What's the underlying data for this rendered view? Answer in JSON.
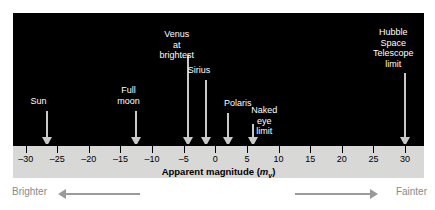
{
  "chart_data": {
    "type": "scatter",
    "title": "",
    "xlabel": "Apparent magnitude (m_v)",
    "xlabel_main": "Apparent magnitude (",
    "xlabel_italic": "m",
    "xlabel_sub": "v",
    "xlabel_close": ")",
    "ylabel": "",
    "xlim": [
      -32,
      33
    ],
    "xticks": [
      -30,
      -25,
      -20,
      -15,
      -10,
      -5,
      0,
      5,
      10,
      15,
      20,
      25,
      30
    ],
    "xtick_labels": [
      "–30",
      "–25",
      "–20",
      "–15",
      "–10",
      "–5",
      "0",
      "5",
      "10",
      "15",
      "20",
      "25",
      "30"
    ],
    "grid": false,
    "legend": "none",
    "annotations": [
      {
        "label": "Sun",
        "value": -26.7,
        "lines": [
          "Sun"
        ],
        "label_top": 83,
        "label_offset": -16,
        "shaft_top": 98,
        "shaft_height": 26
      },
      {
        "label": "Full moon",
        "value": -12.5,
        "lines": [
          "Full",
          "moon"
        ],
        "label_top": 72,
        "label_offset": -19,
        "shaft_top": 98,
        "shaft_height": 26
      },
      {
        "label": "Venus at brightest",
        "value": -4.4,
        "lines": [
          "Venus at",
          "brightest"
        ],
        "label_top": 16,
        "label_offset": -28,
        "shaft_top": 42,
        "shaft_height": 82
      },
      {
        "label": "Sirius",
        "value": -1.5,
        "lines": [
          "Sirius"
        ],
        "label_top": 52,
        "label_offset": -18,
        "shaft_top": 67,
        "shaft_height": 57
      },
      {
        "label": "Polaris",
        "value": 2.0,
        "lines": [
          "Polaris"
        ],
        "label_top": 85,
        "label_offset": -4,
        "shaft_top": 100,
        "shaft_height": 24
      },
      {
        "label": "Naked eye limit",
        "value": 6.0,
        "lines": [
          "Naked",
          "eye limit"
        ],
        "label_top": 92,
        "label_offset": -2,
        "shaft_top": 111,
        "shaft_height": 13
      },
      {
        "label": "Hubble Space Telescope limit",
        "value": 30.0,
        "lines": [
          "Hubble",
          "Space",
          "Telescope",
          "limit"
        ],
        "label_top": 14,
        "label_offset": -32,
        "shaft_top": 60,
        "shaft_height": 64
      }
    ]
  },
  "direction": {
    "brighter_label": "Brighter",
    "fainter_label": "Fainter"
  },
  "colors": {
    "sky": "#000000",
    "axis_band": "#d8d8d6",
    "arrow": "#c9c9c9",
    "label_text": "#ffffff",
    "direction_text": "#8a8a8a"
  }
}
